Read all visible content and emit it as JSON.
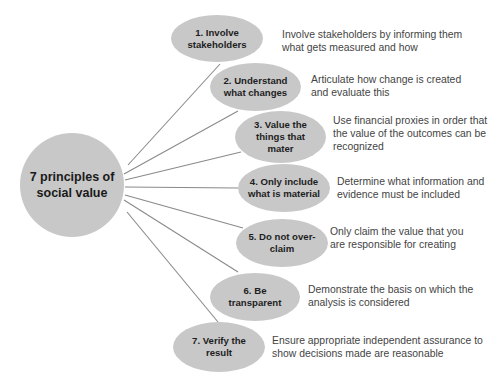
{
  "diagram": {
    "center": {
      "label": "7 principles of\nsocial value"
    },
    "principles": [
      {
        "label": "1. Involve\nstakeholders",
        "description": "Involve stakeholders by informing them\nwhat gets measured and how"
      },
      {
        "label": "2. Understand\nwhat changes",
        "description": "Articulate how change is created\nand evaluate this"
      },
      {
        "label": "3. Value the\nthings that\nmater",
        "description": "Use financial proxies in order that\nthe value of the outcomes can be\nrecognized"
      },
      {
        "label": "4. Only include\nwhat is material",
        "description": "Determine what information and\nevidence must be included"
      },
      {
        "label": "5. Do not over-\nclaim",
        "description": "Only claim the value that you\nare responsible for creating"
      },
      {
        "label": "6. Be\ntransparent",
        "description": "Demonstrate the basis on which the\nanalysis is considered"
      },
      {
        "label": "7. Verify the\nresult",
        "description": "Ensure appropriate independent assurance to\nshow decisions made are reasonable"
      }
    ]
  },
  "colors": {
    "node_fill": "#c8c8c8",
    "line": "#7f7f7f",
    "text": "#1e1e1e",
    "desc_text": "#444444"
  }
}
